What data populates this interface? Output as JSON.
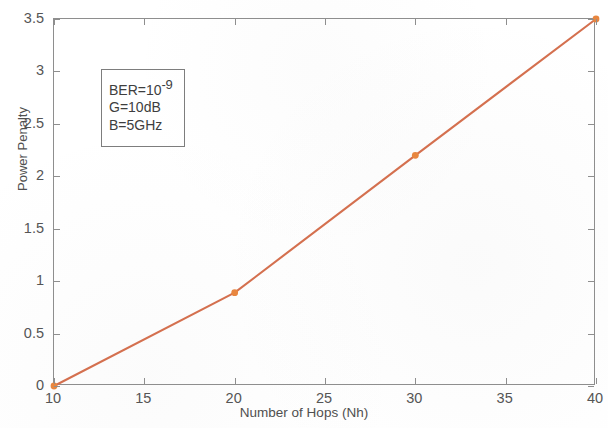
{
  "chart_data": {
    "type": "line",
    "title": "",
    "xlabel": "Number of Hops (Nh)",
    "ylabel": "Power Penalty",
    "xlim": [
      10,
      40
    ],
    "ylim": [
      0,
      3.5
    ],
    "xticks": [
      10,
      15,
      20,
      25,
      30,
      35,
      40
    ],
    "xticklabels": [
      "10",
      "15",
      "20",
      "25",
      "30",
      "35",
      "40"
    ],
    "yticks": [
      0,
      0.5,
      1,
      1.5,
      2,
      2.5,
      3,
      3.5
    ],
    "yticklabels": [
      "0",
      "0.5",
      "1",
      "1.5",
      "2",
      "2.5",
      "3",
      "3.5"
    ],
    "grid": false,
    "legend": null,
    "series": [
      {
        "name": "Power Penalty vs Number of Hops",
        "color": "#d4704f",
        "marker": "point",
        "marker_color": "#e8863f",
        "x": [
          10,
          20,
          30,
          40
        ],
        "y": [
          0,
          0.89,
          2.2,
          3.5
        ]
      }
    ],
    "annotations": [
      {
        "name": "parameter-box",
        "lines": [
          "BER=10⁻9",
          "G=10dB",
          "B=5GHz"
        ],
        "line_prefixes": [
          "BER=10",
          "G=10dB",
          "B=5GHz"
        ],
        "line_superscript": "-9",
        "x_data": 12.6,
        "y_data": 3.02
      }
    ]
  },
  "axis_title_x": "Number of Hops (Nh)",
  "axis_title_y": "Power Penalty",
  "annotation": {
    "line1_base": "BER=10",
    "line1_exp": "-9",
    "line2": "G=10dB",
    "line3": "B=5GHz"
  }
}
